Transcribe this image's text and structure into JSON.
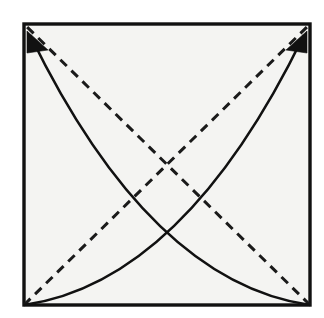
{
  "figure": {
    "kind": "line-diagram",
    "background_color": "#ffffff",
    "canvas": {
      "width": 324,
      "height": 318
    }
  },
  "paper": {
    "name": "square-sheet",
    "fill_color": "#f4f4f2",
    "edge_color": "#111111",
    "edge_width": 3.4,
    "corners": {
      "top_left": [
        24,
        24
      ],
      "top_right": [
        310,
        24
      ],
      "bottom_right": [
        310,
        305
      ],
      "bottom_left": [
        24,
        305
      ]
    }
  },
  "creases": [
    {
      "name": "diagonal-crease-bl-to-tr",
      "style": "dashed",
      "meaning": "valley-fold",
      "color": "#1a1a1a",
      "width": 3.0,
      "dash_pattern": "9 6.5",
      "from": [
        24,
        305
      ],
      "to": [
        310,
        24
      ]
    },
    {
      "name": "diagonal-crease-br-to-tl",
      "style": "dashed",
      "meaning": "valley-fold",
      "color": "#1a1a1a",
      "width": 3.0,
      "dash_pattern": "9 6.5",
      "from": [
        310,
        305
      ],
      "to": [
        24,
        24
      ]
    }
  ],
  "crease_intersection": [
    167,
    164
  ],
  "arrows": [
    {
      "name": "fold-arrow-to-top-left",
      "meaning": "bring bottom-right corner up to top-left corner",
      "color": "#111111",
      "curve_width": 2.6,
      "start": [
        310,
        305
      ],
      "end": [
        30,
        35
      ],
      "control": [
        150,
        282
      ],
      "head": {
        "tip": [
          27,
          31
        ],
        "left": [
          27,
          53
        ],
        "right": [
          48,
          50
        ]
      }
    },
    {
      "name": "fold-arrow-to-top-right",
      "meaning": "bring bottom-left corner up to top-right corner",
      "color": "#111111",
      "curve_width": 2.6,
      "start": [
        24,
        305
      ],
      "end": [
        304,
        35
      ],
      "control": [
        184,
        282
      ],
      "head": {
        "tip": [
          307,
          31
        ],
        "left": [
          286,
          50
        ],
        "right": [
          307,
          53
        ]
      }
    }
  ],
  "arrow_curve_crossing": [
    168,
    236
  ]
}
